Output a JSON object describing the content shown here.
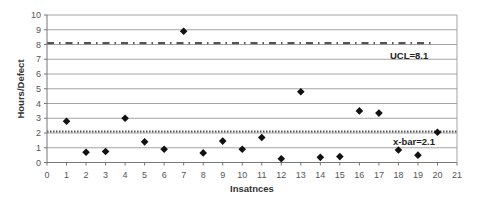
{
  "chart_data": {
    "type": "scatter",
    "title": "",
    "xlabel": "Insatnces",
    "ylabel": "Hours/Defect",
    "xlim": [
      0,
      21
    ],
    "ylim": [
      0,
      10
    ],
    "x_ticks": [
      0,
      1,
      2,
      3,
      4,
      5,
      6,
      7,
      8,
      9,
      10,
      11,
      12,
      13,
      14,
      15,
      16,
      17,
      18,
      19,
      20,
      21
    ],
    "y_ticks": [
      0,
      1,
      2,
      3,
      4,
      5,
      6,
      7,
      8,
      9,
      10
    ],
    "grid": "horizontal",
    "legend": "none",
    "series": [
      {
        "name": "Hours/Defect",
        "marker": "diamond",
        "x": [
          1,
          2,
          3,
          4,
          5,
          6,
          7,
          8,
          9,
          10,
          11,
          12,
          13,
          14,
          15,
          16,
          17,
          18,
          19,
          20
        ],
        "y": [
          2.8,
          0.7,
          0.75,
          3.0,
          1.4,
          0.9,
          8.9,
          0.65,
          1.45,
          0.9,
          1.7,
          0.25,
          4.8,
          0.35,
          0.4,
          3.5,
          3.35,
          0.85,
          0.5,
          2.05
        ]
      }
    ],
    "reference_lines": [
      {
        "name": "UCL",
        "label": "UCL=8.1",
        "value": 8.1,
        "style": "dash-dot",
        "x_start": 0,
        "x_end": 19.8
      },
      {
        "name": "x-bar",
        "label": "x-bar=2.1",
        "value": 2.1,
        "style": "dotted",
        "x_start": 0,
        "x_end": 21
      }
    ]
  },
  "labels": {
    "xlabel": "Insatnces",
    "ylabel": "Hours/Defect",
    "ucl": "UCL=8.1",
    "xbar": "x-bar=2.1"
  }
}
